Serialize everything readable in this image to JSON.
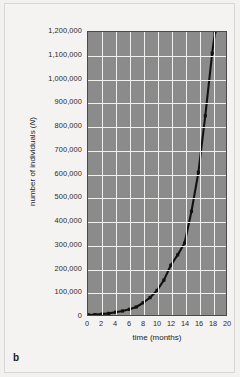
{
  "figure": {
    "panel_label": "b",
    "background_color": "#f2f1ef",
    "plot_background_color": "#8b8b8b",
    "gridline_color": "#f0f0ee",
    "curve_color": "#111111"
  },
  "chart_data": {
    "type": "line",
    "title": "",
    "xlabel": "time (months)",
    "ylabel": "number of individuals (N)",
    "ylabel_plain": "number of individuals (",
    "ylabel_symbol": "N",
    "ylabel_suffix": ")",
    "xlim": [
      0,
      20
    ],
    "ylim": [
      0,
      1200000
    ],
    "grid": true,
    "legend": "none",
    "x_tick_labels": [
      "0",
      "2",
      "4",
      "6",
      "8",
      "10",
      "12",
      "14",
      "16",
      "18",
      "20"
    ],
    "x_tick_values": [
      0,
      2,
      4,
      6,
      8,
      10,
      12,
      14,
      16,
      18,
      20
    ],
    "y_tick_labels": [
      "1,200,000",
      "1,100,000",
      "1,000,000",
      "900,000",
      "800,000",
      "700,000",
      "600,000",
      "500,000",
      "400,000",
      "300,000",
      "200,000",
      "100,000",
      "0"
    ],
    "y_tick_values": [
      1200000,
      1100000,
      1000000,
      900000,
      800000,
      700000,
      600000,
      500000,
      400000,
      300000,
      200000,
      100000,
      0
    ],
    "series": [
      {
        "name": "population growth",
        "marker": "square",
        "x": [
          0,
          1,
          2,
          3,
          4,
          5,
          6,
          7,
          8,
          9,
          10,
          11,
          12,
          13,
          14,
          15,
          16,
          17,
          18,
          18.4
        ],
        "values": [
          1000,
          1900,
          3600,
          6800,
          12000,
          17000,
          24000,
          34000,
          52000,
          74000,
          104000,
          148000,
          211000,
          255000,
          305000,
          440000,
          605000,
          845000,
          1110000,
          1200000
        ]
      }
    ]
  }
}
